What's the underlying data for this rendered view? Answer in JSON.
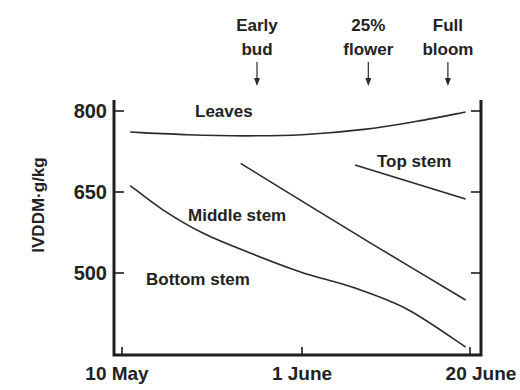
{
  "chart_data": {
    "type": "line",
    "title": "",
    "xlabel": "",
    "ylabel": "IVDDM·g/kg",
    "x_unit": "days after 10 May",
    "xlim": [
      -1,
      42
    ],
    "ylim": [
      340,
      820
    ],
    "grid": false,
    "legend": "none (inline labels)",
    "x_ticks": [
      {
        "value": 0,
        "label": "10 May"
      },
      {
        "value": 22,
        "label": "1 June"
      },
      {
        "value": 41,
        "label": "20 June"
      }
    ],
    "y_ticks": [
      {
        "value": 800,
        "label": "800"
      },
      {
        "value": 650,
        "label": "650"
      },
      {
        "value": 500,
        "label": "500"
      }
    ],
    "series": [
      {
        "name": "Leaves",
        "label": "Leaves",
        "x": [
          1,
          8,
          15,
          22,
          29,
          35,
          40.5
        ],
        "y": [
          761,
          756,
          754,
          756,
          766,
          781,
          798
        ]
      },
      {
        "name": "Top stem",
        "label": "Top stem",
        "x": [
          28,
          40.5
        ],
        "y": [
          700,
          637
        ]
      },
      {
        "name": "Middle stem",
        "label": "Middle stem",
        "x": [
          14.5,
          22,
          30,
          40.5
        ],
        "y": [
          703,
          633,
          553,
          450
        ]
      },
      {
        "name": "Bottom stem",
        "label": "Bottom stem",
        "x": [
          1,
          5,
          10,
          16,
          22,
          28,
          34,
          40.5
        ],
        "y": [
          662,
          617,
          573,
          535,
          501,
          472,
          432,
          363
        ]
      }
    ],
    "annotations": [
      {
        "line1": "Early",
        "line2": "bud",
        "x": 16.5
      },
      {
        "line1": "25%",
        "line2": "flower",
        "x": 29.5
      },
      {
        "line1": "Full",
        "line2": "bloom",
        "x": 38.5
      }
    ]
  }
}
